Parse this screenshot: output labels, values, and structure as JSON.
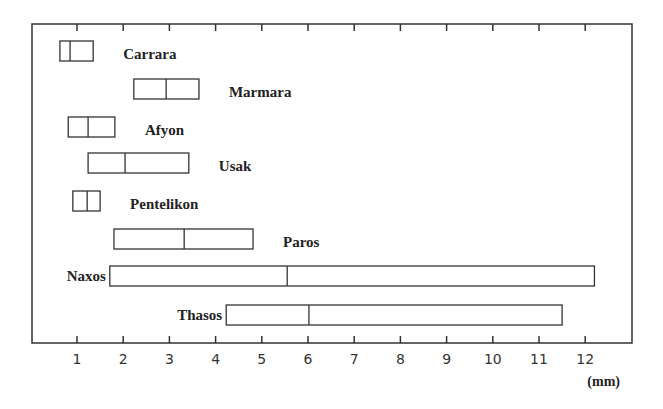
{
  "chart_data": {
    "type": "box-range",
    "title": "",
    "xlabel": "(mm)",
    "ylabel": "",
    "xlim": [
      0.4,
      13.0
    ],
    "grid": false,
    "legend": null,
    "x_ticks": [
      1,
      2,
      3,
      4,
      5,
      6,
      7,
      8,
      9,
      10,
      11,
      12
    ],
    "x_tick_labels": [
      "1",
      "2",
      "3",
      "4",
      "5",
      "6",
      "7",
      "8",
      "9",
      "10",
      "11",
      "12"
    ],
    "categories": [
      "Carrara",
      "Marmara",
      "Afyon",
      "Usak",
      "Pentelikon",
      "Paros",
      "Naxos",
      "Thasos"
    ],
    "series": [
      {
        "name": "Carrara",
        "min": 0.63,
        "median": 0.85,
        "max": 1.35,
        "label_side": "right"
      },
      {
        "name": "Marmara",
        "min": 2.23,
        "median": 2.93,
        "max": 3.64,
        "label_side": "right"
      },
      {
        "name": "Afyon",
        "min": 0.81,
        "median": 1.24,
        "max": 1.82,
        "label_side": "right"
      },
      {
        "name": "Usak",
        "min": 1.24,
        "median": 2.04,
        "max": 3.42,
        "label_side": "right"
      },
      {
        "name": "Pentelikon",
        "min": 0.91,
        "median": 1.22,
        "max": 1.5,
        "label_side": "right"
      },
      {
        "name": "Paros",
        "min": 1.8,
        "median": 3.32,
        "max": 4.81,
        "label_side": "right"
      },
      {
        "name": "Naxos",
        "min": 1.71,
        "median": 5.55,
        "max": 12.2,
        "label_side": "left"
      },
      {
        "name": "Thasos",
        "min": 4.23,
        "median": 6.02,
        "max": 11.5,
        "label_side": "left"
      }
    ]
  }
}
